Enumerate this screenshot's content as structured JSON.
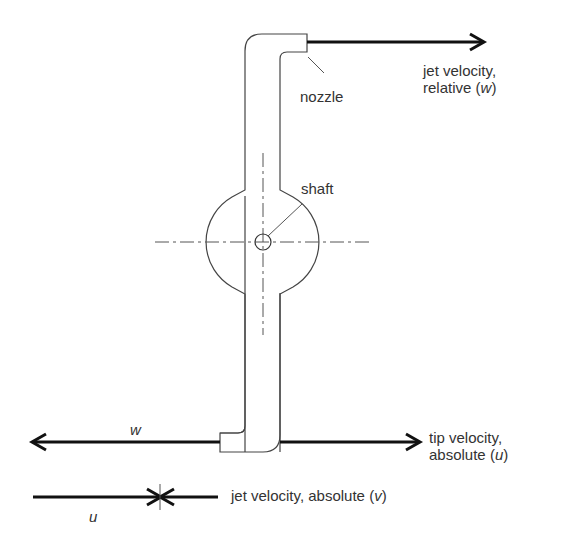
{
  "diagram": {
    "labels": {
      "nozzle": "nozzle",
      "shaft": "shaft",
      "jet_relative_line1": "jet velocity,",
      "jet_relative_line2_prefix": "relative (",
      "jet_relative_symbol": "w",
      "jet_relative_suffix": ")",
      "tip_absolute_line1": "tip velocity,",
      "tip_absolute_line2_prefix": "absolute (",
      "tip_absolute_symbol": "u",
      "tip_absolute_suffix": ")",
      "jet_absolute_prefix": "jet velocity, absolute (",
      "jet_absolute_symbol": "v",
      "jet_absolute_suffix": ")",
      "w_symbol": "w",
      "u_symbol": "u"
    },
    "colors": {
      "line": "#333333",
      "arrow": "#111111",
      "background": "#ffffff"
    }
  }
}
